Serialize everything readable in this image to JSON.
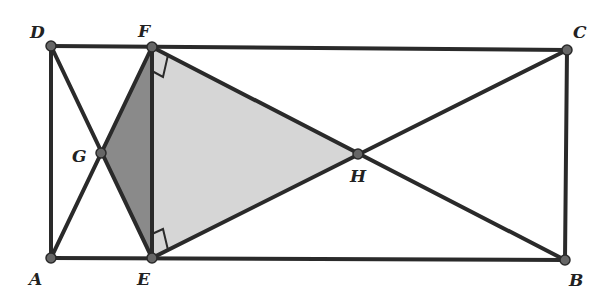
{
  "diagram": {
    "type": "geometry",
    "colors": {
      "line": "#2a2a2a",
      "point": "#666666",
      "shade_dark": "#8a8a8a",
      "shade_light": "#d6d6d6",
      "background": "#ffffff"
    },
    "points": {
      "A": {
        "label": "A",
        "x": 51,
        "y": 258
      },
      "B": {
        "label": "B",
        "x": 565,
        "y": 260
      },
      "C": {
        "label": "C",
        "x": 567,
        "y": 50
      },
      "D": {
        "label": "D",
        "x": 51,
        "y": 46
      },
      "E": {
        "label": "E",
        "x": 152,
        "y": 258
      },
      "F": {
        "label": "F",
        "x": 152,
        "y": 47
      },
      "G": {
        "label": "G",
        "x": 101,
        "y": 153
      },
      "H": {
        "label": "H",
        "x": 358,
        "y": 154
      }
    },
    "labels": [
      {
        "text": "D",
        "x": 30,
        "y": 38
      },
      {
        "text": "F",
        "x": 138,
        "y": 37
      },
      {
        "text": "C",
        "x": 573,
        "y": 38
      },
      {
        "text": "G",
        "x": 72,
        "y": 162
      },
      {
        "text": "H",
        "x": 350,
        "y": 182
      },
      {
        "text": "A",
        "x": 29,
        "y": 285
      },
      {
        "text": "E",
        "x": 137,
        "y": 285
      },
      {
        "text": "B",
        "x": 569,
        "y": 286
      }
    ],
    "segments": [
      [
        "D",
        "C"
      ],
      [
        "A",
        "B"
      ],
      [
        "A",
        "D"
      ],
      [
        "B",
        "C"
      ],
      [
        "E",
        "F"
      ],
      [
        "D",
        "E"
      ],
      [
        "A",
        "F"
      ],
      [
        "F",
        "B"
      ],
      [
        "E",
        "C"
      ]
    ],
    "shaded_regions": [
      {
        "name": "triangle-EFG",
        "vertices": [
          "E",
          "F",
          "G"
        ],
        "fill": "dark"
      },
      {
        "name": "triangle-EFH",
        "vertices": [
          "E",
          "F",
          "H"
        ],
        "fill": "light"
      }
    ],
    "right_angles": [
      {
        "at": "F",
        "between": [
          "E",
          "H"
        ]
      },
      {
        "at": "E",
        "between": [
          "F",
          "H"
        ]
      }
    ]
  }
}
